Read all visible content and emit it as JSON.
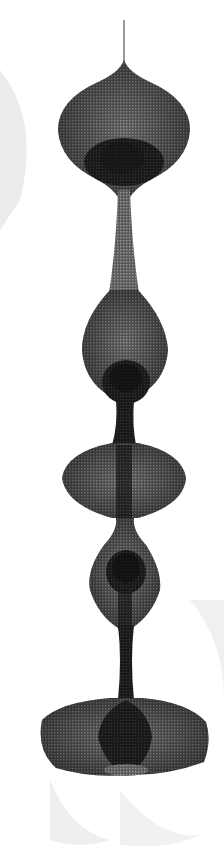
{
  "image": {
    "subject": "hanging looped-wire sculpture",
    "alt": "Black and white photograph of a hanging wire-mesh sculpture with stacked lobed forms",
    "colors": {
      "background": "#ffffff",
      "mesh": "#3a3a3a",
      "mesh_dark": "#141414",
      "shadow": "#e9e9e9"
    }
  }
}
